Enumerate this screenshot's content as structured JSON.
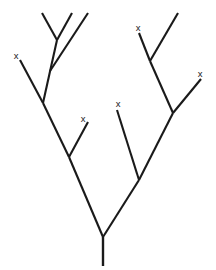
{
  "diagram": {
    "type": "binary-branching-tree",
    "stroke_color": "#1a1a1a",
    "background_color": "#ffffff",
    "marker_label": "x",
    "marker_count": 5,
    "canvas": {
      "width": 216,
      "height": 270
    },
    "trunk": {
      "name": "trunk",
      "x1": 103,
      "y1": 237,
      "x2": 103,
      "y2": 266
    },
    "nodes": [
      {
        "id": "root",
        "x": 103,
        "y": 237
      },
      {
        "id": "left-main",
        "x": 69,
        "y": 157
      },
      {
        "id": "left-upper",
        "x": 43,
        "y": 103
      },
      {
        "id": "left-fork",
        "x": 57,
        "y": 40
      },
      {
        "id": "right-main",
        "x": 139,
        "y": 180
      },
      {
        "id": "right-upper",
        "x": 173,
        "y": 113
      },
      {
        "id": "right-fork",
        "x": 150,
        "y": 61
      }
    ],
    "segments": [
      {
        "name": "root-to-left-main",
        "x1": 103,
        "y1": 237,
        "x2": 69,
        "y2": 157
      },
      {
        "name": "root-to-right-main",
        "x1": 103,
        "y1": 237,
        "x2": 139,
        "y2": 180
      },
      {
        "name": "left-main-to-left-upper",
        "x1": 69,
        "y1": 157,
        "x2": 43,
        "y2": 103
      },
      {
        "name": "left-main-to-tip-c",
        "x1": 69,
        "y1": 157,
        "x2": 88,
        "y2": 122
      },
      {
        "name": "left-upper-to-tip-a",
        "x1": 43,
        "y1": 103,
        "x2": 20,
        "y2": 60
      },
      {
        "name": "left-upper-to-left-fork",
        "x1": 43,
        "y1": 103,
        "x2": 57,
        "y2": 40
      },
      {
        "name": "left-fork-to-tip-1",
        "x1": 57,
        "y1": 40,
        "x2": 42,
        "y2": 13
      },
      {
        "name": "left-fork-to-tip-2",
        "x1": 57,
        "y1": 40,
        "x2": 72,
        "y2": 13
      },
      {
        "name": "left-upper-to-tip-3",
        "x1": 50,
        "y1": 71,
        "x2": 88,
        "y2": 13
      },
      {
        "name": "right-main-to-tip-d",
        "x1": 139,
        "y1": 180,
        "x2": 117,
        "y2": 110
      },
      {
        "name": "right-main-to-right-upper",
        "x1": 139,
        "y1": 180,
        "x2": 173,
        "y2": 113
      },
      {
        "name": "right-upper-to-tip-e",
        "x1": 173,
        "y1": 113,
        "x2": 201,
        "y2": 79
      },
      {
        "name": "right-upper-to-right-fork",
        "x1": 173,
        "y1": 113,
        "x2": 150,
        "y2": 61
      },
      {
        "name": "right-fork-to-tip-b",
        "x1": 150,
        "y1": 61,
        "x2": 139,
        "y2": 33
      },
      {
        "name": "right-fork-to-tip-4",
        "x1": 150,
        "y1": 61,
        "x2": 178,
        "y2": 13
      }
    ],
    "markers": [
      {
        "name": "tip-marker-left-outer",
        "label": "x",
        "x": 16,
        "y": 56
      },
      {
        "name": "tip-marker-left-inner",
        "label": "x",
        "x": 83,
        "y": 119
      },
      {
        "name": "tip-marker-center",
        "label": "x",
        "x": 118,
        "y": 104
      },
      {
        "name": "tip-marker-right-upper",
        "label": "x",
        "x": 138,
        "y": 28
      },
      {
        "name": "tip-marker-right-outer",
        "label": "x",
        "x": 200,
        "y": 74
      }
    ]
  }
}
